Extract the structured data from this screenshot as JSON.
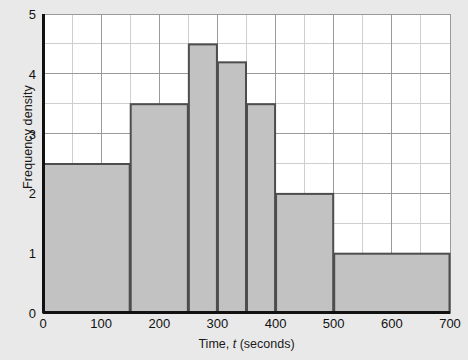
{
  "chart_data": {
    "type": "bar",
    "title": "",
    "subtitle": "",
    "xlabel": "Time, t (seconds)",
    "xlabel_prefix": "Time, ",
    "xlabel_italic": "t",
    "xlabel_suffix": " (seconds)",
    "ylabel": "Frequency density",
    "xlim": [
      0,
      700
    ],
    "ylim": [
      0,
      5
    ],
    "grid": true,
    "grid_x_major_step": 100,
    "grid_x_minor_step": 50,
    "grid_y_major_step": 1,
    "grid_y_minor_step": 0.5,
    "legend": "none",
    "xticks": [
      0,
      100,
      200,
      300,
      400,
      500,
      600,
      700
    ],
    "xtick_labels": [
      "0",
      "100",
      "200",
      "300",
      "400",
      "500",
      "600",
      "700"
    ],
    "yticks": [
      0,
      1,
      2,
      3,
      4,
      5
    ],
    "ytick_labels": [
      "0",
      "1",
      "2",
      "3",
      "4",
      "5"
    ],
    "bin_edges": [
      0,
      150,
      250,
      300,
      350,
      400,
      500,
      700
    ],
    "values": [
      2.5,
      3.5,
      4.5,
      4.2,
      3.5,
      2.0,
      1.0
    ],
    "categories": [
      "0-150",
      "150-250",
      "250-300",
      "300-350",
      "350-400",
      "400-500",
      "500-700"
    ],
    "bars": [
      {
        "x0": 0,
        "x1": 150,
        "height": 2.5
      },
      {
        "x0": 150,
        "x1": 250,
        "height": 3.5
      },
      {
        "x0": 250,
        "x1": 300,
        "height": 4.5
      },
      {
        "x0": 300,
        "x1": 350,
        "height": 4.2
      },
      {
        "x0": 350,
        "x1": 400,
        "height": 3.5
      },
      {
        "x0": 400,
        "x1": 500,
        "height": 2.0
      },
      {
        "x0": 500,
        "x1": 700,
        "height": 1.0
      }
    ],
    "colors": {
      "figure_background": "#e9e9e9",
      "plot_background": "#ffffff",
      "bar_fill": "#c2c2c2",
      "bar_edge": "#4d4d4d",
      "grid_major": "#9a9a9a",
      "grid_minor": "#cfcfcf",
      "axis": "#111111",
      "text": "#111111"
    }
  }
}
